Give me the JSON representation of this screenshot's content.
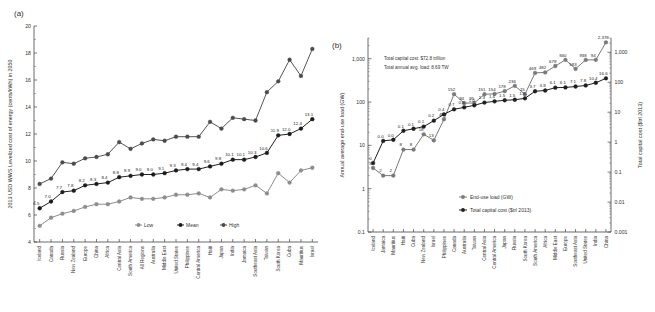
{
  "figure": {
    "panel_a_tag": "(a)",
    "panel_b_tag": "(b)"
  },
  "chart_data": [
    {
      "type": "line",
      "panel": "(a)",
      "title": "",
      "xlabel": "",
      "ylabel": "2013 USD WWS Levelized cost of energy (cents/kWh) in 2050",
      "ylim": [
        4,
        20
      ],
      "yticks": [
        4,
        6,
        8,
        10,
        12,
        14,
        16,
        18,
        20
      ],
      "ytick_labels": [
        "4",
        "6",
        "8",
        "10",
        "12",
        "14",
        "16",
        "18",
        "20"
      ],
      "grid": false,
      "legend_position": "bottom-center",
      "categories": [
        "Iceland",
        "Canada",
        "Russia",
        "New Zealand",
        "Europe",
        "China",
        "Africa",
        "Central Asia",
        "South America",
        "All Regions",
        "Australia",
        "Middle East",
        "United States",
        "Philippines",
        "Central America",
        "Haiti",
        "Japan",
        "India",
        "Jamaica",
        "Southeast Asia",
        "Taiwan",
        "South Korea",
        "Cuba",
        "Mauritius",
        "Israel"
      ],
      "series": [
        {
          "name": "Low",
          "color": "#8d8d8d",
          "values": [
            5.2,
            5.8,
            6.1,
            6.3,
            6.6,
            6.8,
            6.8,
            7.0,
            7.3,
            7.2,
            7.2,
            7.3,
            7.5,
            7.5,
            7.6,
            7.3,
            7.9,
            7.8,
            7.9,
            8.2,
            7.6,
            9.1,
            8.4,
            9.3,
            9.5
          ],
          "labels": []
        },
        {
          "name": "Mean",
          "color": "#1c1c1c",
          "values": [
            6.5,
            7.0,
            7.7,
            7.8,
            8.2,
            8.3,
            8.4,
            8.8,
            8.9,
            9.0,
            9.0,
            9.1,
            9.3,
            9.4,
            9.4,
            9.6,
            9.8,
            10.1,
            10.1,
            10.3,
            10.6,
            11.9,
            12.0,
            12.4,
            13.1
          ],
          "labels": [
            "6.5",
            "7.0",
            "7.7",
            "7.8",
            "8.2",
            "8.3",
            "8.4",
            "8.8",
            "8.9",
            "9.0",
            "9.0",
            "9.1",
            "9.3",
            "9.4",
            "9.4",
            "9.6",
            "9.8",
            "10.1",
            "10.1",
            "10.3",
            "10.6",
            "11.9",
            "12.0",
            "12.4",
            "13.1"
          ]
        },
        {
          "name": "High",
          "color": "#4a4a4a",
          "values": [
            8.3,
            8.7,
            9.9,
            9.8,
            10.2,
            10.3,
            10.5,
            11.4,
            10.9,
            11.3,
            11.6,
            11.5,
            11.8,
            11.8,
            11.8,
            12.9,
            12.4,
            13.2,
            13.1,
            13.0,
            15.1,
            15.9,
            17.5,
            16.3,
            18.3
          ],
          "labels": []
        }
      ]
    },
    {
      "type": "line",
      "panel": "(b)",
      "title": "",
      "xlabel": "",
      "ylabel": "Annual average end-use load (GW)",
      "y2label": "Total capital cost ($trl 2013)",
      "yscale": "log",
      "ylim": [
        0.1,
        3000
      ],
      "ytick_labels": [
        "0.1",
        "1",
        "10",
        "100",
        "1,000"
      ],
      "y2lim": [
        0.001,
        3000
      ],
      "y2tick_labels": [
        "0.001",
        "0.01",
        "0.1",
        "1",
        "10",
        "100",
        "1,000"
      ],
      "grid": false,
      "legend_position": "center-right",
      "annotations": [
        "Total capital cost: $72.8 trillion",
        "Total annual avg. load: 8.69 TW"
      ],
      "categories": [
        "Iceland",
        "Jamaica",
        "Mauritius",
        "Haiti",
        "Cuba",
        "New Zealand",
        "Israel",
        "Philippines",
        "Canada",
        "Australia",
        "Taiwan",
        "Central Asia",
        "Central America",
        "Japan",
        "Russia",
        "South Korea",
        "South America",
        "Africa",
        "Middle East",
        "Europe",
        "Southeast Asia",
        "United States",
        "India",
        "China"
      ],
      "series": [
        {
          "name": "End-use load (GW)",
          "color": "#7a7a7a",
          "values": [
            3,
            2,
            2,
            8,
            8,
            18,
            13,
            40,
            152,
            94,
            95,
            151,
            154,
            178,
            236,
            151,
            469,
            482,
            678,
            940,
            583,
            938,
            940,
            2378
          ],
          "labels": [
            "3",
            "2",
            "2",
            "8",
            "8",
            "18",
            "13",
            "40",
            "152",
            "94",
            "95",
            "151",
            "154",
            "178",
            "236",
            "15",
            "469",
            "482",
            "678",
            "940",
            "583",
            "938",
            "94",
            "2,378"
          ]
        },
        {
          "name": "Total capital cost ($trl 2013)",
          "color": "#1f1f1f",
          "values": [
            0.2,
            1.1,
            1.2,
            2.4,
            2.8,
            3.3,
            5.2,
            8.5,
            12.5,
            14.5,
            17,
            21,
            23,
            25,
            26,
            29,
            50,
            53,
            66,
            67,
            72,
            78,
            96,
            135
          ],
          "labels": [
            "0",
            "0.0",
            "0.0",
            "0.1",
            "0.1",
            "0.1",
            "0.2",
            "0.4",
            "0.7",
            "0.8",
            "1.0",
            "1.3",
            "1.4",
            "1.5",
            "1.5",
            "1.6",
            "3.7",
            "3.8",
            "6.1",
            "6.1",
            "7.1",
            "7.8",
            "10.4",
            "16.6"
          ]
        }
      ]
    }
  ]
}
